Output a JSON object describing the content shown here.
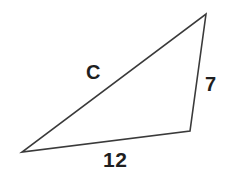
{
  "figure": {
    "kind": "geometry-diagram",
    "shape": "triangle",
    "background_color": "#ffffff",
    "stroke_color": "#3a3a3a",
    "label_color": "#1f1f1f",
    "vertices": {
      "apex": {
        "x": 206,
        "y": 14
      },
      "bottom_right": {
        "x": 190,
        "y": 131
      },
      "bottom_left": {
        "x": 22,
        "y": 152
      }
    },
    "labels": {
      "hypotenuse": "C",
      "vertical_side": "7",
      "base": "12"
    }
  }
}
